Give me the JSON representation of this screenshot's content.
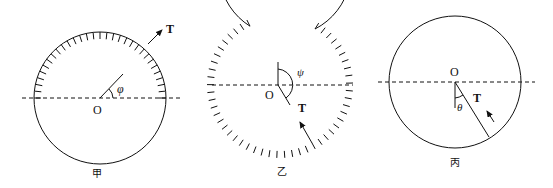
{
  "figures": [
    {
      "id": "jia",
      "caption": "甲",
      "center_label": "O",
      "angle_label": "φ",
      "force_label": "T",
      "hatching": "upper half, inner side",
      "description": "Circle with hatched upper semicircle; radius at angle φ above horizontal; tension T arrow pointing up-right outside circle"
    },
    {
      "id": "yi",
      "caption": "乙",
      "center_label": "O",
      "angle_label": "ψ",
      "force_label": "T",
      "hatching": "outer side, with gap at top",
      "description": "Circle with outer hatching except an opening at top; vertical reference up from O; radius down-right at angle ψ; tension T arrow pointing up-left"
    },
    {
      "id": "bing",
      "caption": "丙",
      "center_label": "O",
      "angle_label": "θ",
      "force_label": "T",
      "hatching": "none",
      "description": "Plain circle; radius from O down-right at angle θ from vertical; small arrow pointing up-left along T"
    }
  ],
  "colors": {
    "stroke": "#111111",
    "background": "#ffffff"
  }
}
